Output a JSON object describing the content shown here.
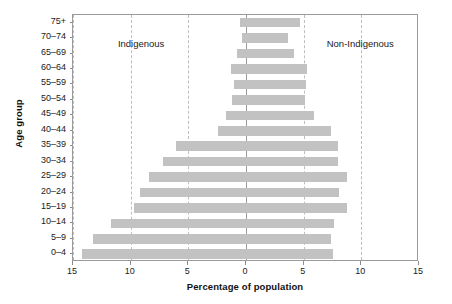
{
  "chart_data": {
    "type": "bar",
    "subtype": "population-pyramid",
    "title": "",
    "xlabel": "Percentage of population",
    "ylabel": "Age group",
    "xlim": [
      -15,
      15
    ],
    "xticks": [
      {
        "value": -15,
        "label": "15"
      },
      {
        "value": -10,
        "label": "10"
      },
      {
        "value": -5,
        "label": "5"
      },
      {
        "value": 0,
        "label": "0"
      },
      {
        "value": 5,
        "label": "5"
      },
      {
        "value": 10,
        "label": "10"
      },
      {
        "value": 15,
        "label": "15"
      }
    ],
    "gridlines": [
      -15,
      -10,
      -5,
      5,
      10,
      15
    ],
    "grid": true,
    "center_axis_value": 0,
    "bar_color": "#c2c2c2",
    "frame_color": "#9a9a9a",
    "grid_color": "#bdbdbd",
    "legend_position": "in-plot-annotations",
    "annotations": [
      {
        "text": "Indigenous",
        "side": "left"
      },
      {
        "text": "Non-Indigenous",
        "side": "right"
      }
    ],
    "categories": [
      "75+",
      "70–74",
      "65–69",
      "60–64",
      "55–59",
      "50–54",
      "45–49",
      "40–44",
      "35–39",
      "30–34",
      "25–29",
      "20–24",
      "15–19",
      "10–14",
      "5–9",
      "0–4"
    ],
    "series": [
      {
        "name": "Indigenous",
        "side": "left",
        "values": [
          0.5,
          0.35,
          0.8,
          1.3,
          1.0,
          1.2,
          1.7,
          2.4,
          6.1,
          7.2,
          8.4,
          9.2,
          9.7,
          11.7,
          13.3,
          14.2
        ]
      },
      {
        "name": "Non-Indigenous",
        "side": "right",
        "values": [
          4.7,
          3.6,
          4.2,
          5.3,
          5.2,
          5.1,
          5.9,
          7.4,
          8.0,
          8.0,
          8.8,
          8.1,
          8.8,
          7.6,
          7.4,
          7.5
        ]
      }
    ]
  },
  "axis": {
    "ylabel": "Age group",
    "xlabel": "Percentage of population"
  },
  "captions": {
    "left": "Indigenous",
    "right": "Non-Indigenous"
  }
}
